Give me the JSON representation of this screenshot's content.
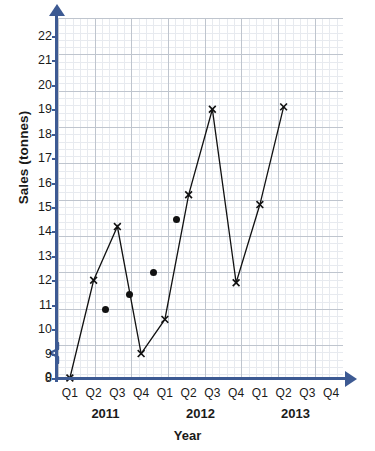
{
  "chart_data": {
    "type": "line",
    "title": "",
    "xlabel": "Year",
    "ylabel": "Sales (tonnes)",
    "ylim": [
      8,
      22
    ],
    "y_ticks": [
      22,
      21,
      20,
      19,
      18,
      17,
      16,
      15,
      14,
      13,
      12,
      11,
      10,
      9,
      8,
      0
    ],
    "axis_break": true,
    "grid": true,
    "grid_style": "graph-paper",
    "legend_position": "none",
    "categories": [
      "2011 Q1",
      "2011 Q2",
      "2011 Q3",
      "2011 Q4",
      "2012 Q1",
      "2012 Q2",
      "2012 Q3",
      "2012 Q4",
      "2013 Q1",
      "2013 Q2",
      "2013 Q3",
      "2013 Q4"
    ],
    "quarter_labels": [
      "Q1",
      "Q2",
      "Q3",
      "Q4",
      "Q1",
      "Q2",
      "Q3",
      "Q4",
      "Q1",
      "Q2",
      "Q3",
      "Q4"
    ],
    "year_groups": [
      {
        "label": "2011",
        "center_index": 1.5
      },
      {
        "label": "2012",
        "center_index": 5.5
      },
      {
        "label": "2013",
        "center_index": 9.5
      }
    ],
    "series": [
      {
        "name": "Sales",
        "marker": "x",
        "connected": true,
        "x": [
          0,
          1,
          2,
          3,
          4,
          5,
          6,
          7,
          8,
          9
        ],
        "values": [
          8.0,
          12.0,
          14.2,
          9.0,
          10.4,
          15.5,
          19.0,
          11.9,
          15.1,
          19.1
        ]
      },
      {
        "name": "Moving average",
        "marker": "dot",
        "connected": false,
        "x": [
          1.5,
          2.5,
          3.5,
          4.5
        ],
        "values": [
          10.8,
          11.4,
          12.3,
          14.5
        ]
      }
    ],
    "colors": {
      "axis": "#3d5a93",
      "marker": "#111111",
      "line": "#111111",
      "grid_minor": "#dfe3ea",
      "grid_major": "#b9bfc9",
      "background": "#ffffff"
    }
  }
}
